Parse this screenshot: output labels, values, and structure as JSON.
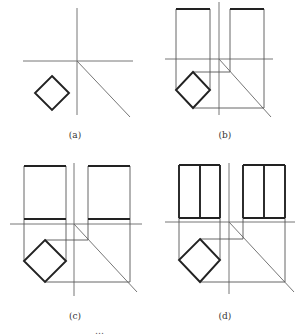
{
  "figure": {
    "panels": [
      {
        "id": "a",
        "label": "(a)",
        "label_pos": [
          75,
          130
        ],
        "axes": {
          "v": [
            77,
            8,
            77,
            115
          ],
          "h": [
            23,
            61,
            133,
            61
          ],
          "diag": [
            77,
            61,
            130,
            117
          ]
        },
        "thin_lines": [],
        "thick_lines": [],
        "diamond": [
          [
            52,
            76
          ],
          [
            69,
            93
          ],
          [
            52,
            110
          ],
          [
            35,
            93
          ]
        ]
      },
      {
        "id": "b",
        "label": "(b)",
        "label_pos": [
          225,
          130
        ],
        "axes": {
          "v": [
            219,
            2,
            219,
            115
          ],
          "h": [
            165,
            59,
            273,
            59
          ],
          "diag": [
            219,
            59,
            271,
            117
          ]
        },
        "thin_lines": [
          [
            176,
            9,
            176,
            90
          ],
          [
            210,
            9,
            210,
            90
          ],
          [
            230,
            9,
            230,
            72
          ],
          [
            264,
            9,
            264,
            108
          ],
          [
            193,
            72,
            230,
            72
          ],
          [
            193,
            108,
            264,
            108
          ]
        ],
        "thick_lines": [
          [
            176,
            9,
            210,
            9
          ],
          [
            230,
            9,
            264,
            9
          ]
        ],
        "diamond": [
          [
            193,
            72
          ],
          [
            210,
            90
          ],
          [
            193,
            108
          ],
          [
            176,
            90
          ]
        ]
      },
      {
        "id": "c",
        "label": "(c)",
        "label_pos": [
          75,
          311
        ],
        "axes": {
          "v": [
            74,
            163,
            74,
            296
          ],
          "h": [
            10,
            224,
            142,
            224
          ],
          "diag": [
            74,
            224,
            137,
            292
          ]
        },
        "thin_lines": [
          [
            24,
            166,
            24,
            261
          ],
          [
            66,
            166,
            66,
            261
          ],
          [
            88,
            166,
            88,
            240
          ],
          [
            130,
            166,
            130,
            282
          ],
          [
            45,
            240,
            88,
            240
          ],
          [
            45,
            282,
            130,
            282
          ]
        ],
        "thick_lines": [
          [
            24,
            166,
            66,
            166
          ],
          [
            24,
            219,
            66,
            219
          ],
          [
            88,
            166,
            130,
            166
          ],
          [
            88,
            219,
            130,
            219
          ]
        ],
        "diamond": [
          [
            45,
            240
          ],
          [
            66,
            261
          ],
          [
            45,
            282
          ],
          [
            24,
            261
          ]
        ]
      },
      {
        "id": "d",
        "label": "(d)",
        "label_pos": [
          225,
          311
        ],
        "axes": {
          "v": [
            229,
            163,
            229,
            294
          ],
          "h": [
            165,
            222,
            295,
            222
          ],
          "diag": [
            229,
            222,
            294,
            292
          ]
        },
        "thin_lines": [
          [
            179,
            218,
            179,
            260
          ],
          [
            220,
            218,
            220,
            260
          ],
          [
            243,
            218,
            243,
            239
          ],
          [
            285,
            218,
            285,
            282
          ],
          [
            200,
            239,
            243,
            239
          ],
          [
            200,
            282,
            285,
            282
          ]
        ],
        "thick_lines": [
          [
            179,
            165,
            220,
            165
          ],
          [
            179,
            218,
            220,
            218
          ],
          [
            179,
            165,
            179,
            218
          ],
          [
            220,
            165,
            220,
            218
          ],
          [
            200,
            165,
            200,
            218
          ],
          [
            243,
            165,
            285,
            165
          ],
          [
            243,
            218,
            285,
            218
          ],
          [
            243,
            165,
            243,
            218
          ],
          [
            285,
            165,
            285,
            218
          ],
          [
            264,
            165,
            264,
            218
          ]
        ],
        "diamond": [
          [
            200,
            239
          ],
          [
            220,
            260
          ],
          [
            200,
            282
          ],
          [
            179,
            260
          ]
        ]
      }
    ],
    "caption_partial": "…"
  }
}
